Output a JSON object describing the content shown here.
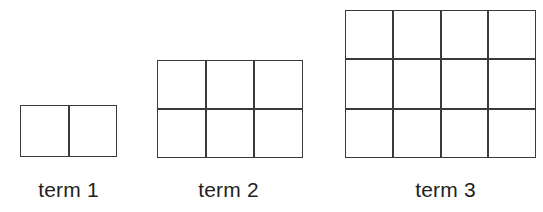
{
  "figure": {
    "type": "growing-rectangle-pattern",
    "background_color": "#ffffff",
    "line_color": "#3a3a3a",
    "text_color": "#231f20",
    "terms": [
      {
        "label": "term 1",
        "term_number": 1,
        "columns": 2,
        "rows": 1,
        "square_count": 2,
        "cells": [
          "",
          ""
        ]
      },
      {
        "label": "term 2",
        "term_number": 2,
        "columns": 3,
        "rows": 2,
        "square_count": 6,
        "cells": [
          "",
          "",
          "",
          "",
          "",
          ""
        ]
      },
      {
        "label": "term 3",
        "term_number": 3,
        "columns": 4,
        "rows": 3,
        "square_count": 12,
        "cells": [
          "",
          "",
          "",
          "",
          "",
          "",
          "",
          "",
          "",
          "",
          "",
          ""
        ]
      }
    ]
  },
  "chart_data": {
    "type": "bar",
    "title": "",
    "xlabel": "",
    "ylabel": "",
    "categories": [
      "term 1",
      "term 2",
      "term 3"
    ],
    "series": [
      {
        "name": "columns",
        "values": [
          2,
          3,
          4
        ]
      },
      {
        "name": "rows",
        "values": [
          1,
          2,
          3
        ]
      },
      {
        "name": "squares",
        "values": [
          2,
          6,
          12
        ]
      }
    ]
  }
}
